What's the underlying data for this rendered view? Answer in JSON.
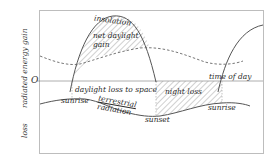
{
  "diagram": {
    "axis": {
      "y_label": "radiated energy",
      "gain_label": "gain",
      "loss_label": "loss",
      "zero_label": "O",
      "x_label": "time of day"
    },
    "curves": {
      "insolation": "insolation",
      "terrestrial_radiation_line1": "terrestrial",
      "terrestrial_radiation_line2": "radiation"
    },
    "regions": {
      "net_daylight_gain_line1": "net daylight",
      "net_daylight_gain_line2": "gain",
      "daylight_loss": "daylight loss to space",
      "night_loss": "night loss"
    },
    "events": {
      "sunrise_left": "sunrise",
      "sunset": "sunset",
      "sunrise_right": "sunrise"
    },
    "colors": {
      "line": "#555555",
      "frame": "#bbbbbb",
      "hatch": "#888888",
      "text": "#2a2a2a"
    }
  }
}
